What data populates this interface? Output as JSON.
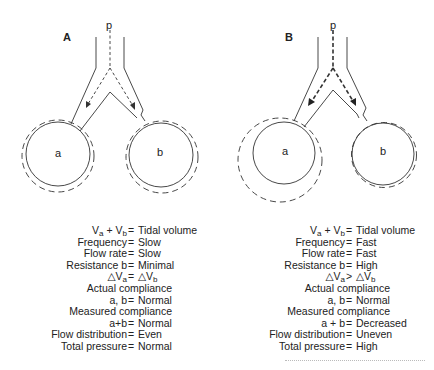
{
  "panels": [
    {
      "label": "A",
      "pressure_label": "p",
      "lung_a": "a",
      "lung_b": "b",
      "equations": [
        {
          "lhs": "Va + Vb",
          "op": "=",
          "rhs": "Tidal volume"
        },
        {
          "lhs": "Frequency",
          "op": "=",
          "rhs": "Slow"
        },
        {
          "lhs": "Flow rate",
          "op": "=",
          "rhs": "Slow"
        },
        {
          "lhs": "Resistance b",
          "op": "=",
          "rhs": "Minimal"
        },
        {
          "lhs": "△Va",
          "op": "=",
          "rhs": "△Vb"
        },
        {
          "lhs": "Actual compliance",
          "op": "",
          "rhs": ""
        },
        {
          "lhs": "a, b",
          "op": "=",
          "rhs": "Normal"
        },
        {
          "lhs": "Measured compliance",
          "op": "",
          "rhs": ""
        },
        {
          "lhs": "a+b",
          "op": "=",
          "rhs": "Normal"
        },
        {
          "lhs": "Flow distribution",
          "op": "=",
          "rhs": "Even"
        },
        {
          "lhs": "Total pressure",
          "op": "=",
          "rhs": "Normal"
        }
      ]
    },
    {
      "label": "B",
      "pressure_label": "p",
      "lung_a": "a",
      "lung_b": "b",
      "equations": [
        {
          "lhs": "Va + Vb",
          "op": "=",
          "rhs": "Tidal volume"
        },
        {
          "lhs": "Frequency",
          "op": "=",
          "rhs": "Fast"
        },
        {
          "lhs": "Flow rate",
          "op": "=",
          "rhs": "Fast"
        },
        {
          "lhs": "Resistance b",
          "op": "=",
          "rhs": "High"
        },
        {
          "lhs": "△Va",
          "op": ">",
          "rhs": "△Vb"
        },
        {
          "lhs": "Actual compliance",
          "op": "",
          "rhs": ""
        },
        {
          "lhs": "a, b",
          "op": "=",
          "rhs": "Normal"
        },
        {
          "lhs": "Measured compliance",
          "op": "",
          "rhs": ""
        },
        {
          "lhs": "a + b",
          "op": "=",
          "rhs": "Decreased"
        },
        {
          "lhs": "Flow distribution",
          "op": "=",
          "rhs": "Uneven"
        },
        {
          "lhs": "Total pressure",
          "op": "=",
          "rhs": "High"
        }
      ]
    }
  ],
  "style": {
    "line_color": "#333333",
    "background": "#ffffff"
  }
}
